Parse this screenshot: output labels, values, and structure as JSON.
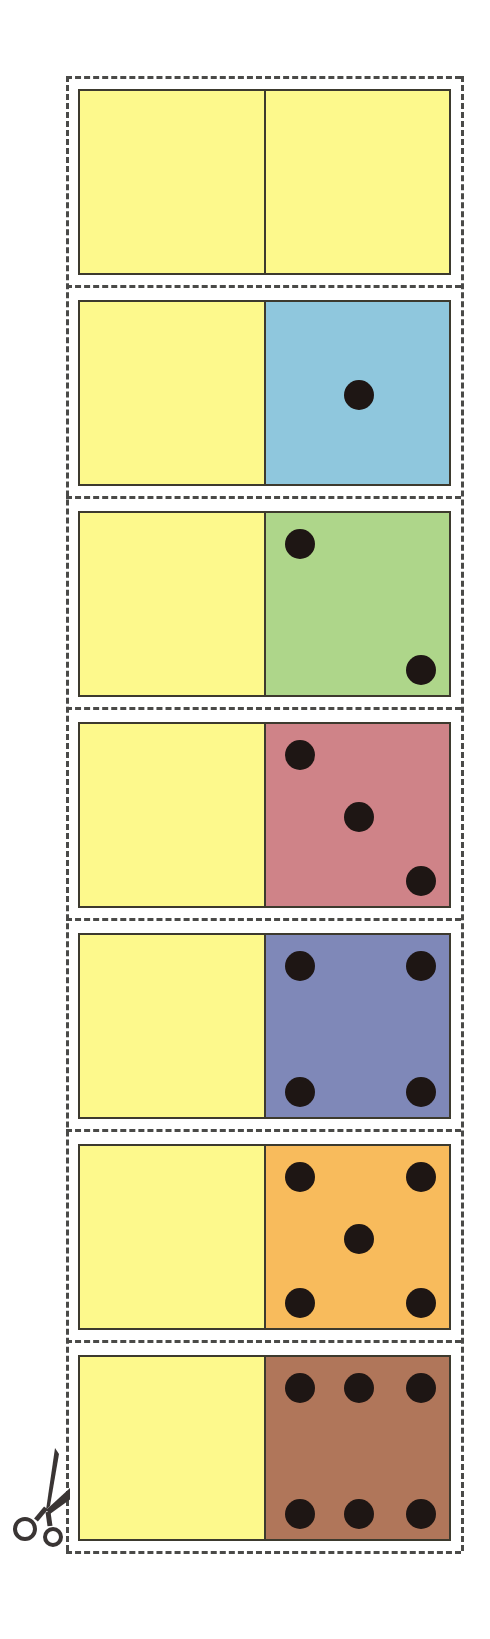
{
  "sheet": {
    "title": "Domino cut-out strip",
    "blank_half_color": "#fdf98c",
    "line_color": "#3d3a2e",
    "pip_color": "#1e1614",
    "cut_line_color": "#4a4a48",
    "scissors_icon": "scissors-icon"
  },
  "dominoes": [
    {
      "index": 0,
      "left_value": 0,
      "right_value": 0,
      "right_color": "#fdf98c"
    },
    {
      "index": 1,
      "left_value": 0,
      "right_value": 1,
      "right_color": "#8fc7dd"
    },
    {
      "index": 2,
      "left_value": 0,
      "right_value": 2,
      "right_color": "#aed68a"
    },
    {
      "index": 3,
      "left_value": 0,
      "right_value": 3,
      "right_color": "#cf8388"
    },
    {
      "index": 4,
      "left_value": 0,
      "right_value": 4,
      "right_color": "#7f88b8"
    },
    {
      "index": 5,
      "left_value": 0,
      "right_value": 5,
      "right_color": "#f8bb5c"
    },
    {
      "index": 6,
      "left_value": 0,
      "right_value": 6,
      "right_color": "#b0765a"
    }
  ],
  "pip_layouts": {
    "0": [],
    "1": [
      [
        "m",
        "m"
      ]
    ],
    "2": [
      [
        "l",
        "t"
      ],
      [
        "r",
        "b"
      ]
    ],
    "3": [
      [
        "l",
        "t"
      ],
      [
        "m",
        "m"
      ],
      [
        "r",
        "b"
      ]
    ],
    "4": [
      [
        "l",
        "t"
      ],
      [
        "r",
        "t"
      ],
      [
        "l",
        "b"
      ],
      [
        "r",
        "b"
      ]
    ],
    "5": [
      [
        "l",
        "t"
      ],
      [
        "r",
        "t"
      ],
      [
        "m",
        "m"
      ],
      [
        "l",
        "b"
      ],
      [
        "r",
        "b"
      ]
    ],
    "6": [
      [
        "l",
        "t"
      ],
      [
        "m",
        "t"
      ],
      [
        "r",
        "t"
      ],
      [
        "l",
        "b"
      ],
      [
        "m",
        "b"
      ],
      [
        "r",
        "b"
      ]
    ]
  }
}
